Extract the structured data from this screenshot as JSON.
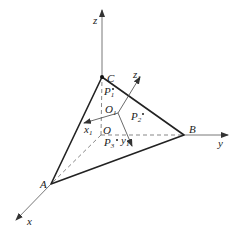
{
  "diagram": {
    "type": "3d-coordinate-tetrahedron",
    "colors": {
      "stroke": "#333333",
      "text": "#222222",
      "background": "#ffffff"
    },
    "axes": {
      "x": {
        "label": "x"
      },
      "y": {
        "label": "y"
      },
      "z": {
        "label": "z"
      }
    },
    "local_axes": {
      "x1": {
        "label": "x",
        "sub": "1"
      },
      "y1": {
        "label": "y",
        "sub": "1"
      },
      "z1": {
        "label": "z",
        "sub": "1"
      }
    },
    "vertices": {
      "A": "A",
      "B": "B",
      "C": "C",
      "O": "O",
      "O1": {
        "label": "O",
        "sub": "1"
      }
    },
    "points": [
      {
        "label": "P",
        "sub": "1"
      },
      {
        "label": "P",
        "sub": "2"
      },
      {
        "label": "P",
        "sub": "3"
      }
    ]
  }
}
